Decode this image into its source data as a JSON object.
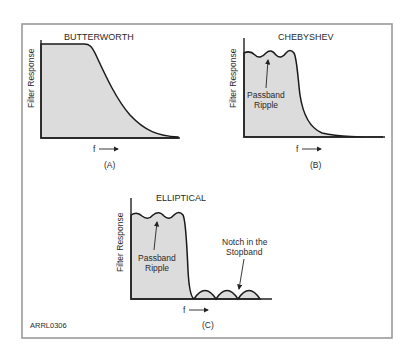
{
  "figure": {
    "id_label": "ARRL0306",
    "frame_color": "#9a9a9a",
    "fill_color": "#dcdcdc"
  },
  "panels": [
    {
      "key": "A",
      "title": "BUTTERWORTH",
      "ylabel": "Filter Response",
      "xlabel": "f",
      "caption": "(A)",
      "annotations": []
    },
    {
      "key": "B",
      "title": "CHEBYSHEV",
      "ylabel": "Filter Response",
      "xlabel": "f",
      "caption": "(B)",
      "annotations": [
        {
          "line1": "Passband",
          "line2": "Ripple"
        }
      ]
    },
    {
      "key": "C",
      "title": "ELLIPTICAL",
      "ylabel": "Filter Response",
      "xlabel": "f",
      "caption": "(C)",
      "annotations": [
        {
          "line1": "Passband",
          "line2": "Ripple"
        },
        {
          "line1": "Notch in the",
          "line2": "Stopband"
        }
      ]
    }
  ]
}
